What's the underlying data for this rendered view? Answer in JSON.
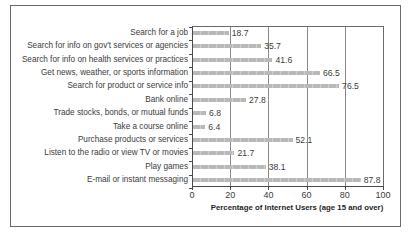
{
  "chart_data": {
    "type": "bar",
    "orientation": "horizontal",
    "title": "",
    "xlabel": "Percentage of Internet Users (age 15 and over)",
    "ylabel": "",
    "xlim": [
      0,
      100
    ],
    "xticks": [
      "0",
      "20",
      "40",
      "60",
      "80",
      "100"
    ],
    "grid": "vertical",
    "legend": null,
    "categories": [
      "Search for a job",
      "Search for info on gov't services or agencies",
      "Search for info on health services or practices",
      "Get news, weather, or sports information",
      "Search for product or service info",
      "Bank online",
      "Trade stocks, bonds, or mutual funds",
      "Take a course online",
      "Purchase products or services",
      "Listen to the radio or view TV or movies",
      "Play games",
      "E-mail or instant messaging"
    ],
    "values": [
      18.7,
      35.7,
      41.6,
      66.5,
      76.5,
      27.8,
      6.8,
      6.4,
      52.1,
      21.7,
      38.1,
      87.8
    ],
    "value_labels": [
      "18.7",
      "35.7",
      "41.6",
      "66.5",
      "76.5",
      "27.8",
      "6.8",
      "6.4",
      "52.1",
      "21.7",
      "38.1",
      "87.8"
    ],
    "colors": {
      "bar": "#bdbdbd",
      "text": "#3c3c3c",
      "frame": "#6a6a6a"
    }
  }
}
